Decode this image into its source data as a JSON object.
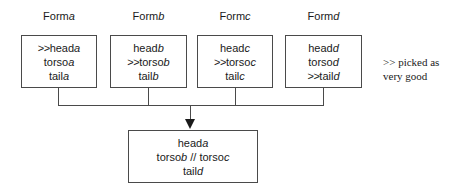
{
  "diagram": {
    "columns": [
      {
        "label_prefix": "Form",
        "label_var": "a",
        "lines": [
          {
            "mark": ">>",
            "text": "head",
            "var": "a"
          },
          {
            "mark": "",
            "text": "torso",
            "var": "a"
          },
          {
            "mark": "",
            "text": "tail",
            "var": "a"
          }
        ]
      },
      {
        "label_prefix": "Form",
        "label_var": "b",
        "lines": [
          {
            "mark": "",
            "text": "head",
            "var": "b"
          },
          {
            "mark": ">>",
            "text": "torso",
            "var": "b"
          },
          {
            "mark": "",
            "text": "tail",
            "var": "b"
          }
        ]
      },
      {
        "label_prefix": "Form",
        "label_var": "c",
        "lines": [
          {
            "mark": "",
            "text": "head",
            "var": "c"
          },
          {
            "mark": ">>",
            "text": "torso",
            "var": "c"
          },
          {
            "mark": "",
            "text": "tail",
            "var": "c"
          }
        ]
      },
      {
        "label_prefix": "Form",
        "label_var": "d",
        "lines": [
          {
            "mark": "",
            "text": "head",
            "var": "d"
          },
          {
            "mark": "",
            "text": "torso",
            "var": "d"
          },
          {
            "mark": ">>",
            "text": "tail",
            "var": "d"
          }
        ]
      }
    ],
    "result": {
      "lines": [
        {
          "text": "head",
          "var": "a"
        },
        {
          "text": "torso",
          "var": "b",
          "separator": " // ",
          "text2": "torso",
          "var2": "c"
        },
        {
          "text": "tail",
          "var": "d"
        }
      ]
    },
    "legend": {
      "line1": ">> picked as",
      "line2": "very good"
    },
    "colors": {
      "background": "#ffffff",
      "box_border": "#4a4a4a",
      "connector": "#4a4a4a",
      "text": "#1a1a1a",
      "arrow": "#1a1a1a"
    }
  }
}
